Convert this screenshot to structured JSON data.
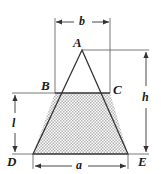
{
  "figure": {
    "background_color": "#ffffff",
    "line_color": "#333333",
    "shade_color": "#c8c8c8",
    "vertices": [
      {
        "name": "A",
        "label": "A",
        "role": "apex-of-triangle",
        "x": 82,
        "y": 50
      },
      {
        "name": "B",
        "label": "B",
        "role": "left-end-of-top-chord",
        "x": 55,
        "y": 93
      },
      {
        "name": "C",
        "label": "C",
        "role": "right-end-of-top-chord",
        "x": 110,
        "y": 93
      },
      {
        "name": "D",
        "label": "D",
        "role": "bottom-left-corner",
        "x": 33,
        "y": 154
      },
      {
        "name": "E",
        "label": "E",
        "role": "bottom-right-corner",
        "x": 128,
        "y": 154
      }
    ],
    "dimensions": [
      {
        "name": "b",
        "label": "b",
        "position": "top",
        "measures": "width of chord BC"
      },
      {
        "name": "h",
        "label": "h",
        "position": "right",
        "measures": "total height from A to base DE"
      },
      {
        "name": "l",
        "label": "l",
        "position": "left",
        "measures": "height of shaded trapezoid"
      },
      {
        "name": "a",
        "label": "a",
        "position": "bottom",
        "measures": "width of base DE"
      }
    ],
    "shaded_region": {
      "name": "trapezoid-BCED",
      "fill_pattern": "stipple-dots",
      "corners": [
        "B",
        "C",
        "E",
        "D"
      ]
    }
  }
}
